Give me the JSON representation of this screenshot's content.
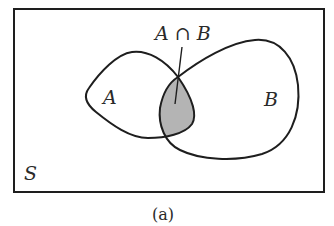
{
  "diagram": {
    "type": "venn",
    "universe_label": "S",
    "set_a_label": "A",
    "set_b_label": "B",
    "intersection_label": "A ∩ B",
    "caption": "(a)",
    "colors": {
      "stroke": "#1e1e1e",
      "intersection_fill": "#b4b4b4",
      "background": "#ffffff"
    }
  }
}
